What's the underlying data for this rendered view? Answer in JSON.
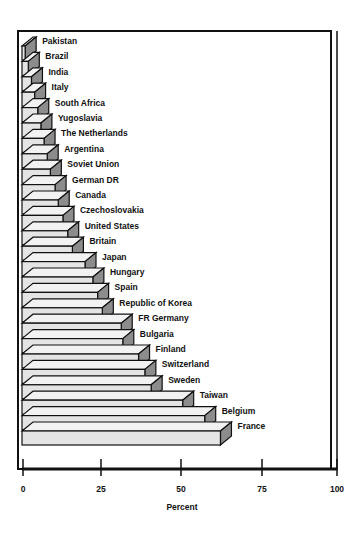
{
  "chart_data": {
    "type": "bar",
    "orientation": "horizontal",
    "style": "3d-stacked-staircase",
    "title": "",
    "xlabel": "Percent",
    "ylabel": "",
    "xlim": [
      0,
      100
    ],
    "xticks": [
      0,
      25,
      50,
      75,
      100
    ],
    "grid": false,
    "legend": null,
    "categories": [
      "Pakistan",
      "Brazil",
      "India",
      "Italy",
      "South Africa",
      "Yugoslavia",
      "The Netherlands",
      "Argentina",
      "Soviet Union",
      "German DR",
      "Canada",
      "Czechoslovakia",
      "United States",
      "Britain",
      "Japan",
      "Hungary",
      "Spain",
      "Republic of Korea",
      "FR Germany",
      "Bulgaria",
      "Finland",
      "Switzerland",
      "Sweden",
      "Taiwan",
      "Belgium",
      "France"
    ],
    "values": [
      1,
      2,
      3,
      4,
      5,
      6,
      7,
      8,
      9,
      10.5,
      11.5,
      13,
      14.5,
      16,
      20,
      22.5,
      24,
      25.5,
      31.5,
      32,
      37,
      39,
      41,
      51,
      58,
      63
    ]
  },
  "axis": {
    "xlabel": "Percent",
    "ticks": [
      "0",
      "25",
      "50",
      "75",
      "100"
    ]
  },
  "colors": {
    "face": "#e4e4e4",
    "side": "#8c8c8c",
    "top": "#f2f2f2",
    "outline": "#111111"
  }
}
